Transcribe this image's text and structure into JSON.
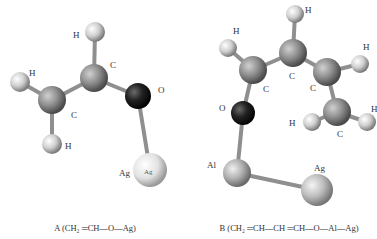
{
  "colors": {
    "carbon": "#8a8a8a",
    "hydrogen": "#d6d6d6",
    "oxygen": "#222222",
    "silver": "#e4e4e4",
    "aluminum": "#b5b5b5",
    "bond": "#9a9a9a"
  },
  "molecule_a": {
    "caption": "A (CH₂ ═CH—O—Ag)",
    "labels": {
      "h_top": "H",
      "c_upper": "C",
      "h_left": "H",
      "c_lower": "C",
      "h_bottom": "H",
      "o": "O",
      "ag": "Ag",
      "ag_inner": "Ag"
    }
  },
  "molecule_b": {
    "caption": "B (CH₂ ═CH—CH ═CH—O—Al—Ag)",
    "labels": {
      "h_top": "H",
      "c_center": "C",
      "h_left": "H",
      "c_left": "C",
      "c_right": "C",
      "h_right_top": "H",
      "c_lower": "C",
      "h_lower_left": "H",
      "h_lower_right": "H",
      "o": "O",
      "al": "Al",
      "ag": "Ag"
    }
  }
}
